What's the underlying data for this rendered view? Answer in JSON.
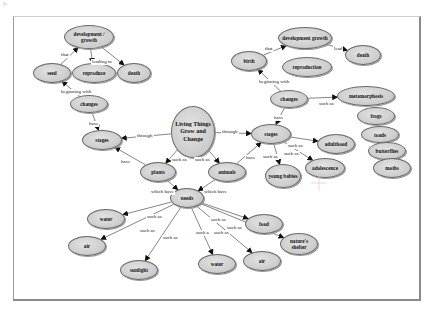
{
  "diagram": {
    "title": "Living Things Grow and Change",
    "corner_text": "p.",
    "nodes": [
      {
        "id": "n_center",
        "label": "Living Things Grow and Change",
        "x": 171,
        "y": 106,
        "w": 44,
        "h": 52,
        "center": true
      },
      {
        "id": "n_devL",
        "label": "development / growth",
        "x": 64,
        "y": 25,
        "w": 50,
        "h": 24
      },
      {
        "id": "n_seed",
        "label": "seed",
        "x": 33,
        "y": 63,
        "w": 38,
        "h": 20
      },
      {
        "id": "n_reproL",
        "label": "reproduce",
        "x": 72,
        "y": 63,
        "w": 44,
        "h": 20
      },
      {
        "id": "n_deathL",
        "label": "death",
        "x": 117,
        "y": 63,
        "w": 34,
        "h": 20
      },
      {
        "id": "n_changesL",
        "label": "changes",
        "x": 70,
        "y": 95,
        "w": 38,
        "h": 18
      },
      {
        "id": "n_stagesL",
        "label": "stages",
        "x": 82,
        "y": 130,
        "w": 40,
        "h": 20
      },
      {
        "id": "n_devR",
        "label": "development growth",
        "x": 278,
        "y": 27,
        "w": 54,
        "h": 22
      },
      {
        "id": "n_deathR",
        "label": "death",
        "x": 345,
        "y": 45,
        "w": 36,
        "h": 20
      },
      {
        "id": "n_birth",
        "label": "birth",
        "x": 231,
        "y": 51,
        "w": 36,
        "h": 20
      },
      {
        "id": "n_reproR",
        "label": "reproduction",
        "x": 282,
        "y": 57,
        "w": 50,
        "h": 20
      },
      {
        "id": "n_changesR",
        "label": "changes",
        "x": 270,
        "y": 90,
        "w": 38,
        "h": 18
      },
      {
        "id": "n_stagesR",
        "label": "stages",
        "x": 251,
        "y": 124,
        "w": 40,
        "h": 20
      },
      {
        "id": "n_meta",
        "label": "metamorphosis",
        "x": 337,
        "y": 86,
        "w": 58,
        "h": 20
      },
      {
        "id": "n_frogs",
        "label": "frogs",
        "x": 357,
        "y": 107,
        "w": 38,
        "h": 18
      },
      {
        "id": "n_toads",
        "label": "toads",
        "x": 361,
        "y": 126,
        "w": 38,
        "h": 17
      },
      {
        "id": "n_butterflies",
        "label": "butterflies",
        "x": 368,
        "y": 142,
        "w": 38,
        "h": 18
      },
      {
        "id": "n_moths",
        "label": "moths",
        "x": 373,
        "y": 158,
        "w": 38,
        "h": 20
      },
      {
        "id": "n_adulthood",
        "label": "adulthood",
        "x": 317,
        "y": 134,
        "w": 38,
        "h": 20
      },
      {
        "id": "n_adolescence",
        "label": "adolescence",
        "x": 305,
        "y": 158,
        "w": 40,
        "h": 20
      },
      {
        "id": "n_young",
        "label": "young babies",
        "x": 265,
        "y": 164,
        "w": 36,
        "h": 24
      },
      {
        "id": "n_plants",
        "label": "plants",
        "x": 140,
        "y": 162,
        "w": 36,
        "h": 20
      },
      {
        "id": "n_animals",
        "label": "animals",
        "x": 208,
        "y": 162,
        "w": 38,
        "h": 20
      },
      {
        "id": "n_needs",
        "label": "needs",
        "x": 170,
        "y": 188,
        "w": 34,
        "h": 20
      },
      {
        "id": "n_water1",
        "label": "water",
        "x": 87,
        "y": 209,
        "w": 38,
        "h": 20
      },
      {
        "id": "n_air1",
        "label": "air",
        "x": 68,
        "y": 236,
        "w": 38,
        "h": 20
      },
      {
        "id": "n_sunlight",
        "label": "sunlight",
        "x": 120,
        "y": 260,
        "w": 38,
        "h": 20
      },
      {
        "id": "n_food",
        "label": "food",
        "x": 245,
        "y": 214,
        "w": 38,
        "h": 20
      },
      {
        "id": "n_shelter",
        "label": "nature's shelter",
        "x": 280,
        "y": 233,
        "w": 38,
        "h": 22
      },
      {
        "id": "n_water2",
        "label": "water",
        "x": 198,
        "y": 254,
        "w": 38,
        "h": 20
      },
      {
        "id": "n_air2",
        "label": "air",
        "x": 243,
        "y": 251,
        "w": 38,
        "h": 20
      }
    ],
    "edges": [
      {
        "from": "n_seed",
        "to": "n_devL",
        "label": "that",
        "lx": 60,
        "ly": 52
      },
      {
        "from": "n_devL",
        "to": "n_reproL",
        "label": "leading to",
        "lx": 91,
        "ly": 59
      },
      {
        "from": "n_devL",
        "to": "n_deathL",
        "label": "",
        "lx": 0,
        "ly": 0
      },
      {
        "from": "n_changesL",
        "to": "n_seed",
        "label": "beginning with",
        "lx": 60,
        "ly": 89
      },
      {
        "from": "n_changesL",
        "to": "n_stagesL",
        "label": "have",
        "lx": 88,
        "ly": 121
      },
      {
        "from": "n_center",
        "to": "n_stagesL",
        "label": "through",
        "lx": 136,
        "ly": 133
      },
      {
        "from": "n_plants",
        "to": "n_stagesL",
        "label": "have",
        "lx": 120,
        "ly": 159
      },
      {
        "from": "n_birth",
        "to": "n_devR",
        "label": "that",
        "lx": 264,
        "ly": 46
      },
      {
        "from": "n_devR",
        "to": "n_deathR",
        "label": "lead",
        "lx": 333,
        "ly": 46
      },
      {
        "from": "n_changesR",
        "to": "n_birth",
        "label": "beginning with",
        "lx": 258,
        "ly": 79
      },
      {
        "from": "n_changesR",
        "to": "n_meta",
        "label": "such as",
        "lx": 318,
        "ly": 101
      },
      {
        "from": "n_changesR",
        "to": "n_stagesR",
        "label": "have",
        "lx": 273,
        "ly": 115
      },
      {
        "from": "n_center",
        "to": "n_stagesR",
        "label": "through",
        "lx": 221,
        "ly": 129
      },
      {
        "from": "n_animals",
        "to": "n_stagesR",
        "label": "have",
        "lx": 245,
        "ly": 155
      },
      {
        "from": "n_stagesR",
        "to": "n_adulthood",
        "label": "such as",
        "lx": 287,
        "ly": 143
      },
      {
        "from": "n_stagesR",
        "to": "n_adolescence",
        "label": "such as",
        "lx": 283,
        "ly": 151
      },
      {
        "from": "n_stagesR",
        "to": "n_young",
        "label": "such as",
        "lx": 262,
        "ly": 154
      },
      {
        "from": "n_center",
        "to": "n_plants",
        "label": "such as",
        "lx": 171,
        "ly": 157
      },
      {
        "from": "n_center",
        "to": "n_animals",
        "label": "such as",
        "lx": 194,
        "ly": 157
      },
      {
        "from": "n_plants",
        "to": "n_needs",
        "label": "which have",
        "lx": 150,
        "ly": 189
      },
      {
        "from": "n_animals",
        "to": "n_needs",
        "label": "which have",
        "lx": 203,
        "ly": 189
      },
      {
        "from": "n_needs",
        "to": "n_water1",
        "label": "such as",
        "lx": 146,
        "ly": 214
      },
      {
        "from": "n_needs",
        "to": "n_air1",
        "label": "such as",
        "lx": 139,
        "ly": 228
      },
      {
        "from": "n_needs",
        "to": "n_sunlight",
        "label": "such as",
        "lx": 162,
        "ly": 235
      },
      {
        "from": "n_needs",
        "to": "n_water2",
        "label": "such a",
        "lx": 195,
        "ly": 230
      },
      {
        "from": "n_needs",
        "to": "n_air2",
        "label": "such as",
        "lx": 213,
        "ly": 230
      },
      {
        "from": "n_needs",
        "to": "n_food",
        "label": "such as",
        "lx": 210,
        "ly": 217
      },
      {
        "from": "n_needs",
        "to": "n_shelter",
        "label": "such as",
        "lx": 226,
        "ly": 225
      }
    ],
    "colors": {
      "node_fill": "#cfcfcf",
      "node_border": "#6a6a6a",
      "edge": "#333333",
      "frame": "#8a8a8a"
    }
  }
}
